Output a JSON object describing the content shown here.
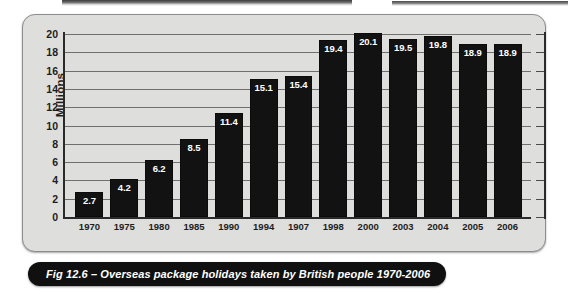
{
  "figure": {
    "caption": "Fig 12.6 – Overseas package holidays taken by British people 1970-2006",
    "panel_background": "#dededc",
    "bar_color": "#121212",
    "gridline_color": "#6f6f6f",
    "caption_background": "#101010",
    "caption_text_color": "#ffffff"
  },
  "chart_data": {
    "type": "bar",
    "title": "Fig 12.6 – Overseas package holidays taken by British people 1970-2006",
    "xlabel": "",
    "ylabel": "Millions",
    "categories": [
      "1970",
      "1975",
      "1980",
      "1985",
      "1990",
      "1994",
      "1907",
      "1998",
      "2000",
      "2003",
      "2004",
      "2005",
      "2006"
    ],
    "values": [
      2.7,
      4.2,
      6.2,
      8.5,
      11.4,
      15.1,
      15.4,
      19.4,
      20.1,
      19.5,
      19.8,
      18.9,
      18.9
    ],
    "value_labels": [
      "2.7",
      "4.2",
      "6.2",
      "8.5",
      "11.4",
      "15.1",
      "15.4",
      "19.4",
      "20.1",
      "19.5",
      "19.8",
      "18.9",
      "18.9"
    ],
    "ylim": [
      0,
      20
    ],
    "yticks": [
      0,
      2,
      4,
      6,
      8,
      10,
      12,
      14,
      16,
      18,
      20
    ],
    "ytick_labels": [
      "0",
      "2",
      "4",
      "6",
      "8",
      "10",
      "12",
      "14",
      "16",
      "18",
      "20"
    ],
    "grid": true,
    "grid_axis": "y",
    "legend": false,
    "legend_position": "none",
    "data_labels_inside_bars": true
  }
}
